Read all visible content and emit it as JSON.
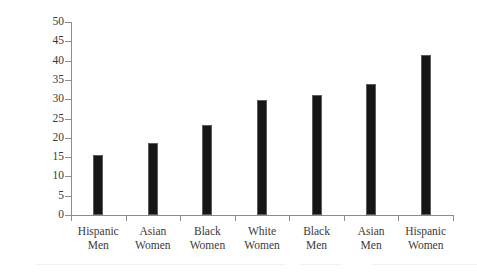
{
  "chart_data": {
    "type": "bar",
    "title": "",
    "subtitle": "",
    "xlabel": "",
    "ylabel": "Percentage",
    "ylim": [
      0,
      50
    ],
    "ytick_step": 5,
    "yticks": [
      50,
      45,
      40,
      35,
      30,
      25,
      20,
      15,
      10,
      5,
      0
    ],
    "ytick_labels": [
      "50",
      "45",
      "40",
      "35",
      "30",
      "25",
      "20",
      "15",
      "10",
      "5",
      "0"
    ],
    "grid": false,
    "legend": false,
    "legend_position": "none",
    "bar_color": "#161616",
    "axis_color": "#8c8c8c",
    "text_color": "#3a3a3a",
    "categories": [
      "Hispanic Men",
      "Asian Women",
      "Black Women",
      "White Women",
      "Black Men",
      "Asian Men",
      "Hispanic Women"
    ],
    "category_lines": [
      {
        "line1": "Hispanic",
        "line2": "Men"
      },
      {
        "line1": "Asian",
        "line2": "Women"
      },
      {
        "line1": "Black",
        "line2": "Women"
      },
      {
        "line1": "White",
        "line2": "Women"
      },
      {
        "line1": "Black",
        "line2": "Men"
      },
      {
        "line1": "Asian",
        "line2": "Men"
      },
      {
        "line1": "Hispanic",
        "line2": "Women"
      }
    ],
    "values": [
      15.5,
      18.7,
      23.3,
      29.8,
      31.1,
      33.9,
      41.5
    ],
    "annotations": []
  }
}
